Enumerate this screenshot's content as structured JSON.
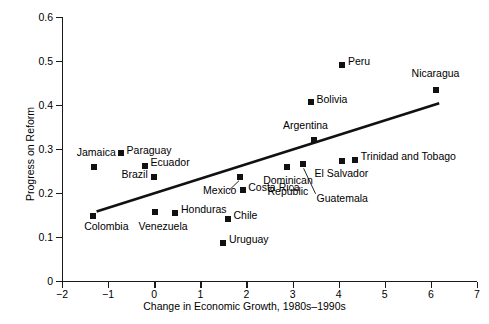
{
  "chart_data": {
    "type": "scatter",
    "title": "",
    "xlabel": "Change in Economic Growth, 1980s–1990s",
    "ylabel": "Progress on Reform",
    "xlim": [
      -2,
      7
    ],
    "ylim": [
      0,
      0.6
    ],
    "xticks": [
      "−2",
      "−1",
      "0",
      "1",
      "2",
      "3",
      "4",
      "5",
      "6",
      "7"
    ],
    "xtick_values": [
      -2,
      -1,
      0,
      1,
      2,
      3,
      4,
      5,
      6,
      7
    ],
    "yticks": [
      "0",
      "0.1",
      "0.2",
      "0.3",
      "0.4",
      "0.5",
      "0.6"
    ],
    "ytick_values": [
      0,
      0.1,
      0.2,
      0.3,
      0.4,
      0.5,
      0.6
    ],
    "grid": false,
    "legend": false,
    "marker_color": "#111111",
    "line_color": "#111111",
    "points": [
      {
        "label": "Jamaica",
        "x": -1.3,
        "y": 0.26,
        "lx": -1.68,
        "ly": 0.292,
        "align": "left"
      },
      {
        "label": "Paraguay",
        "x": -0.72,
        "y": 0.29,
        "lx": -0.6,
        "ly": 0.296,
        "align": "left"
      },
      {
        "label": "Ecuador",
        "x": -0.2,
        "y": 0.262,
        "lx": -0.08,
        "ly": 0.268,
        "align": "left"
      },
      {
        "label": "Brazil",
        "x": 0.0,
        "y": 0.236,
        "lx": -0.14,
        "ly": 0.242,
        "align": "right"
      },
      {
        "label": "Colombia",
        "x": -1.32,
        "y": 0.147,
        "lx": -1.52,
        "ly": 0.122,
        "align": "left"
      },
      {
        "label": "Venezuela",
        "x": 0.02,
        "y": 0.156,
        "lx": -0.34,
        "ly": 0.122,
        "align": "left"
      },
      {
        "label": "Honduras",
        "x": 0.44,
        "y": 0.155,
        "lx": 0.58,
        "ly": 0.161,
        "align": "left"
      },
      {
        "label": "Mexico",
        "x": 1.86,
        "y": 0.236,
        "lx": 1.06,
        "ly": 0.204,
        "align": "left"
      },
      {
        "label": "Costa Rica",
        "x": 1.92,
        "y": 0.206,
        "lx": 2.04,
        "ly": 0.212,
        "align": "left"
      },
      {
        "label": "Chile",
        "x": 1.6,
        "y": 0.141,
        "lx": 1.72,
        "ly": 0.147,
        "align": "left"
      },
      {
        "label": "Uruguay",
        "x": 1.5,
        "y": 0.087,
        "lx": 1.62,
        "ly": 0.093,
        "align": "left"
      },
      {
        "label": "Dominican\nRepublic",
        "x": 2.88,
        "y": 0.258,
        "lx": 2.9,
        "ly": 0.228,
        "align": "center"
      },
      {
        "label": "Guatemala",
        "x": 3.22,
        "y": 0.266,
        "lx": 3.52,
        "ly": 0.186,
        "align": "left"
      },
      {
        "label": "Argentina",
        "x": 3.46,
        "y": 0.32,
        "lx": 3.28,
        "ly": 0.352,
        "align": "center"
      },
      {
        "label": "Bolivia",
        "x": 3.4,
        "y": 0.406,
        "lx": 3.52,
        "ly": 0.412,
        "align": "left"
      },
      {
        "label": "Peru",
        "x": 4.08,
        "y": 0.492,
        "lx": 4.2,
        "ly": 0.498,
        "align": "left"
      },
      {
        "label": "El Salvador",
        "x": 4.08,
        "y": 0.272,
        "lx": 4.06,
        "ly": 0.244,
        "align": "center"
      },
      {
        "label": "Trinidad and Tobago",
        "x": 4.36,
        "y": 0.276,
        "lx": 4.48,
        "ly": 0.282,
        "align": "left"
      },
      {
        "label": "Nicaragua",
        "x": 6.12,
        "y": 0.434,
        "lx": 6.1,
        "ly": 0.47,
        "align": "center"
      }
    ],
    "trendline": {
      "x1": -1.25,
      "y1": 0.158,
      "x2": 6.18,
      "y2": 0.404
    },
    "leaders": [
      {
        "x1": 1.62,
        "y1": 0.206,
        "x2": 1.84,
        "y2": 0.228
      },
      {
        "x1": 3.5,
        "y1": 0.198,
        "x2": 3.24,
        "y2": 0.256
      }
    ]
  }
}
